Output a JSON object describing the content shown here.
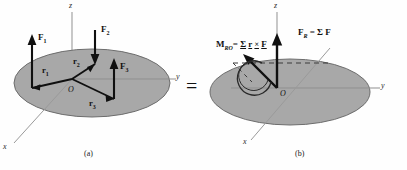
{
  "figure": {
    "relation_symbol": "=",
    "panel_a": {
      "caption": "(a)",
      "axes": {
        "x": "x",
        "y": "y",
        "z": "z"
      },
      "origin": "O",
      "forces": [
        {
          "name": "F1",
          "base": "F",
          "sub": "1",
          "direction": "up"
        },
        {
          "name": "F2",
          "base": "F",
          "sub": "2",
          "direction": "down"
        },
        {
          "name": "F3",
          "base": "F",
          "sub": "3",
          "direction": "up"
        }
      ],
      "position_vectors": [
        {
          "name": "r1",
          "base": "r",
          "sub": "1"
        },
        {
          "name": "r2",
          "base": "r",
          "sub": "2"
        },
        {
          "name": "r3",
          "base": "r",
          "sub": "3"
        }
      ]
    },
    "panel_b": {
      "caption": "(b)",
      "axes": {
        "x": "x",
        "y": "y",
        "z": "z"
      },
      "origin": "O",
      "resultant_force": {
        "symbol": "F",
        "subscript": "R",
        "equals": "=",
        "expression_sigma": "Σ",
        "expression_term": "F"
      },
      "resultant_moment": {
        "symbol": "M",
        "subscript": "RO",
        "equals": "=",
        "expression_sigma": "Σ",
        "expression_r": "r",
        "expression_cross": "×",
        "expression_f": "F"
      }
    },
    "colors": {
      "plane_fill": "#a8a8a8",
      "plane_stroke": "#6f6f6f",
      "vector_stroke": "#101010",
      "axis_stroke": "#8d8d8d",
      "text": "#111111",
      "background": "#ffffff"
    }
  }
}
